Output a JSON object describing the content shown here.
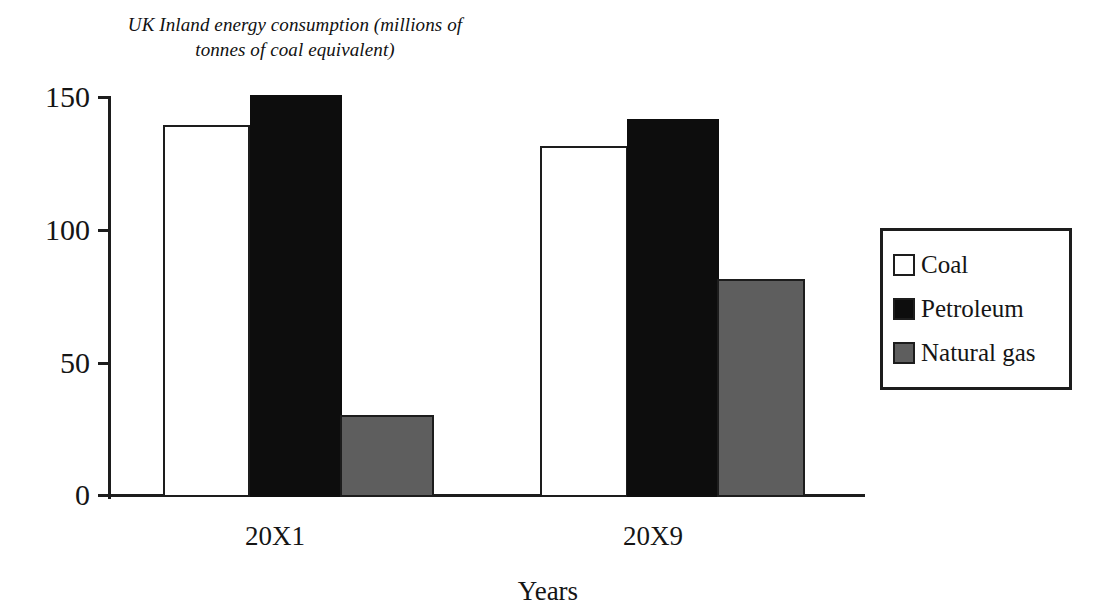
{
  "chart_data": {
    "type": "bar",
    "title": "UK Inland energy consumption (millions of tonnes of coal equivalent)",
    "title_line1": "UK Inland energy consumption (millions of",
    "title_line2": "tonnes of coal equivalent)",
    "xlabel": "Years",
    "ylabel": "",
    "categories": [
      "20X1",
      "20X9"
    ],
    "ylim": [
      0,
      150
    ],
    "yticks": [
      0,
      50,
      100,
      150
    ],
    "ytick_labels": [
      "0",
      "50",
      "100",
      "150"
    ],
    "grid": false,
    "legend_position": "right",
    "series": [
      {
        "name": "Coal",
        "values": [
          140,
          132
        ],
        "color": "#ffffff"
      },
      {
        "name": "Petroleum",
        "values": [
          151,
          142
        ],
        "color": "#0d0d0d"
      },
      {
        "name": "Natural gas",
        "values": [
          31,
          82
        ],
        "color": "#5e5e5e"
      }
    ]
  },
  "legend": {
    "items": [
      {
        "label": "Coal",
        "swatch": "coal"
      },
      {
        "label": "Petroleum",
        "swatch": "petroleum"
      },
      {
        "label": "Natural gas",
        "swatch": "gas"
      }
    ]
  }
}
